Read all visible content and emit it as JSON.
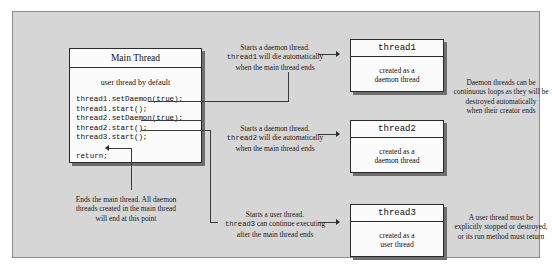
{
  "main_thread": {
    "title": "Main Thread",
    "subtitle": "user thread by default",
    "code_lines": [
      "thread1.setDaemon(true);",
      "thread1.start();",
      "thread2.setDaemon(true);",
      "thread2.start();",
      "thread3.start();"
    ],
    "return_statement": "return;"
  },
  "threads": [
    {
      "name": "thread1",
      "desc_line1": "created as a",
      "desc_line2": "daemon thread"
    },
    {
      "name": "thread2",
      "desc_line1": "created as a",
      "desc_line2": "daemon thread"
    },
    {
      "name": "thread3",
      "desc_line1": "created as a",
      "desc_line2": "user thread"
    }
  ],
  "notes": {
    "thread1": {
      "line1": "Starts a daemon thread.",
      "mono": "thread1",
      "line2": " will die automatically",
      "line3": "when the main thread ends"
    },
    "thread2": {
      "line1": "Starts a daemon thread.",
      "mono": "thread2",
      "line2": " will die automatically",
      "line3": "when the main thread ends"
    },
    "thread3": {
      "line1": "Starts a user thread.",
      "mono": "thread3",
      "line2": " can continue executing",
      "line3": "after the main thread ends"
    },
    "return": {
      "line1": "Ends the main thread. All daemon",
      "line2": "threads created in the main thread",
      "line3": "will end at this point"
    },
    "daemon_rule": {
      "line1": "Daemon threads can be",
      "line2": "continuous loops as they will be",
      "line3": "destroyed automatically",
      "line4": "when their creator ends"
    },
    "user_rule": {
      "line1": "A user thread must be",
      "line2": "explicitly stopped or destroyed,",
      "line3": "or its run method must return"
    }
  },
  "colors": {
    "frame_background": "#d6d6d6",
    "box_fill": "#fbfbfb",
    "border": "#2b2b2b",
    "shadow": "#6f6f6f"
  }
}
